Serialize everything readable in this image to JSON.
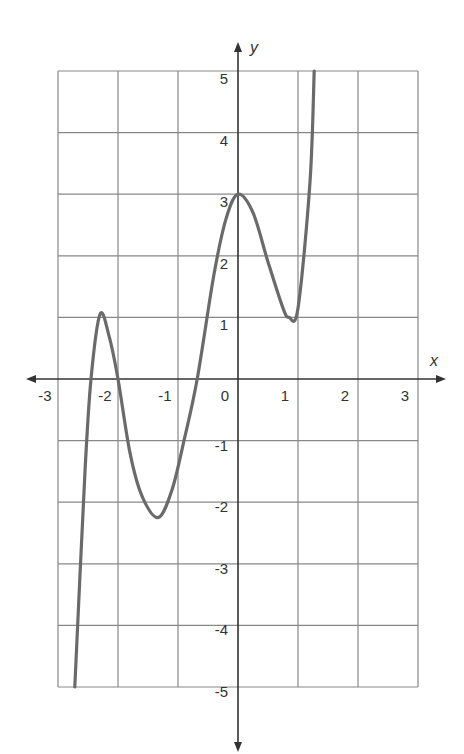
{
  "chart_data": {
    "type": "line",
    "title": "",
    "xlabel": "x",
    "ylabel": "y",
    "xlim": [
      -3,
      3
    ],
    "ylim": [
      -5,
      5
    ],
    "grid": true,
    "x_ticks": [
      "-3",
      "-2",
      "-1",
      "0",
      "1",
      "2",
      "3"
    ],
    "y_ticks": [
      "5",
      "4",
      "3",
      "2",
      "1",
      "-1",
      "-2",
      "-3",
      "-4",
      "-5"
    ],
    "series": [
      {
        "name": "curve",
        "color": "#6a6a6a",
        "x": [
          -2.72,
          -2.55,
          -2.45,
          -2.3,
          -2.15,
          -2.0,
          -1.8,
          -1.6,
          -1.33,
          -1.1,
          -0.9,
          -0.68,
          -0.4,
          -0.2,
          0.0,
          0.25,
          0.5,
          0.75,
          0.85,
          1.0,
          1.2,
          1.27
        ],
        "y": [
          -5.0,
          -1.5,
          0.0,
          1.05,
          0.7,
          0.0,
          -1.2,
          -1.9,
          -2.25,
          -1.8,
          -1.0,
          0.0,
          1.7,
          2.6,
          3.0,
          2.7,
          1.9,
          1.15,
          1.0,
          1.15,
          3.2,
          5.0
        ]
      }
    ],
    "key_points": {
      "local_max_1": [
        -2.3,
        1.05
      ],
      "local_min_1": [
        -1.33,
        -2.25
      ],
      "local_max_2": [
        0,
        3
      ],
      "local_min_2": [
        0.85,
        1
      ]
    }
  }
}
